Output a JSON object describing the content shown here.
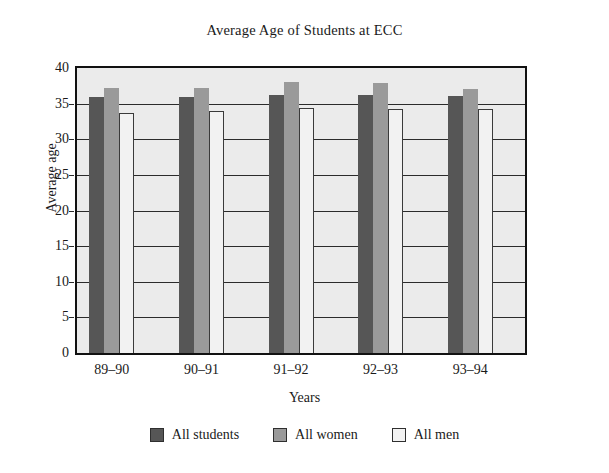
{
  "chart_data": {
    "type": "bar",
    "title": "Average Age of Students at ECC",
    "xlabel": "Years",
    "ylabel": "Average age",
    "categories": [
      "89–90",
      "90–91",
      "91–92",
      "92–93",
      "93–94"
    ],
    "series": [
      {
        "name": "All students",
        "color": "#565656",
        "values": [
          35.9,
          35.9,
          36.2,
          36.2,
          36.1
        ]
      },
      {
        "name": "All women",
        "color": "#9a9a9a",
        "values": [
          37.2,
          37.2,
          38.0,
          37.9,
          37.1
        ]
      },
      {
        "name": "All men",
        "color": "#f2f2f2",
        "values": [
          33.7,
          34.0,
          34.4,
          34.2,
          34.2
        ]
      }
    ],
    "ylim": [
      0,
      40
    ],
    "yticks": [
      0,
      5,
      10,
      15,
      20,
      25,
      30,
      35,
      40
    ],
    "ytick_labels": [
      "0",
      "5",
      "10",
      "15",
      "20",
      "25",
      "30",
      "35",
      "40"
    ],
    "grid": true,
    "legend_position": "bottom",
    "plot_background": "#ebebeb",
    "frame_color": "#111111"
  }
}
